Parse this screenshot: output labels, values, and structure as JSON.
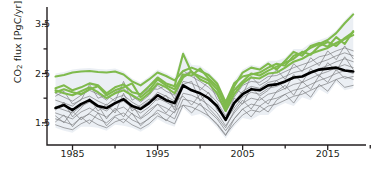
{
  "chart_data": {
    "type": "line",
    "title": "",
    "xlabel": "",
    "ylabel": "CO2 flux [PgC/yr]",
    "ylabel_html": "CO<sub>2</sub> flux [PgC/yr]",
    "xlim": [
      1982,
      2019.5
    ],
    "ylim": [
      1.05,
      3.85
    ],
    "grid": false,
    "legend": "none",
    "y_ticks_major": [
      1.5,
      2.5,
      3.5
    ],
    "y_ticks_minor": [
      2.0,
      3.0
    ],
    "y_tick_labels": [
      "1.5",
      "2.5",
      "3.5"
    ],
    "x_ticks_major": [
      1985,
      1995,
      2005,
      2015
    ],
    "x_ticks_minor": [
      1990,
      2000,
      2010,
      2020
    ],
    "x_tick_labels": [
      "1985",
      "1995",
      "2005",
      "2015"
    ],
    "x": [
      1983,
      1984,
      1985,
      1986,
      1987,
      1988,
      1989,
      1990,
      1991,
      1992,
      1993,
      1994,
      1995,
      1996,
      1997,
      1998,
      1999,
      2000,
      2001,
      2002,
      2003,
      2004,
      2005,
      2006,
      2007,
      2008,
      2009,
      2010,
      2011,
      2012,
      2013,
      2014,
      2015,
      2016,
      2017,
      2018
    ],
    "colors": {
      "ensemble_gray": "#808285",
      "highlight_green": "#7fba4c",
      "mean_black": "#000000",
      "spread_band": "#e8ecf2",
      "axis": "#231f20",
      "background": "#ffffff"
    },
    "series": [
      {
        "name": "green-1",
        "group": "highlight",
        "color": "#7fba4c",
        "values": [
          2.44,
          2.47,
          2.52,
          2.54,
          2.55,
          2.53,
          2.52,
          2.54,
          2.48,
          2.34,
          2.26,
          2.38,
          2.52,
          2.45,
          2.36,
          2.55,
          2.62,
          2.55,
          2.47,
          2.3,
          1.92,
          2.3,
          2.44,
          2.48,
          2.52,
          2.62,
          2.7,
          2.66,
          2.86,
          2.92,
          3.02,
          3.1,
          3.18,
          3.32,
          3.52,
          3.7
        ]
      },
      {
        "name": "green-2",
        "group": "highlight",
        "color": "#7fba4c",
        "values": [
          2.2,
          2.26,
          2.16,
          2.22,
          2.3,
          2.26,
          2.1,
          2.22,
          2.28,
          2.12,
          2.08,
          2.24,
          2.42,
          2.3,
          2.24,
          2.9,
          2.52,
          2.44,
          2.36,
          2.18,
          1.86,
          2.24,
          2.52,
          2.62,
          2.58,
          2.7,
          2.58,
          2.76,
          2.94,
          2.86,
          3.06,
          3.12,
          3.04,
          3.24,
          3.1,
          3.36
        ]
      },
      {
        "name": "green-3",
        "group": "highlight",
        "color": "#7fba4c",
        "values": [
          2.12,
          2.18,
          2.12,
          2.08,
          2.18,
          2.24,
          2.06,
          2.16,
          2.22,
          2.3,
          2.02,
          2.16,
          2.38,
          2.26,
          2.18,
          2.48,
          2.46,
          2.6,
          2.4,
          2.24,
          1.8,
          2.16,
          2.34,
          2.5,
          2.46,
          2.56,
          2.64,
          2.72,
          2.8,
          2.94,
          2.88,
          3.06,
          3.14,
          3.06,
          3.22,
          3.34
        ]
      },
      {
        "name": "green-4",
        "group": "highlight",
        "color": "#7fba4c",
        "values": [
          2.16,
          2.1,
          2.06,
          2.14,
          2.22,
          2.12,
          2.0,
          2.1,
          2.16,
          2.06,
          1.96,
          2.1,
          2.3,
          2.22,
          2.1,
          2.42,
          2.54,
          2.38,
          2.3,
          2.1,
          1.74,
          2.08,
          2.3,
          2.42,
          2.4,
          2.5,
          2.52,
          2.62,
          2.74,
          2.8,
          2.9,
          2.96,
          3.02,
          3.12,
          3.2,
          3.28
        ]
      },
      {
        "name": "gray-1",
        "group": "ensemble",
        "color": "#808285",
        "values": [
          2.1,
          2.02,
          1.94,
          2.06,
          2.16,
          2.08,
          1.96,
          2.12,
          2.2,
          2.04,
          1.92,
          2.06,
          2.26,
          2.14,
          2.06,
          2.56,
          2.44,
          2.34,
          2.22,
          2.06,
          1.72,
          2.02,
          2.26,
          2.34,
          2.32,
          2.44,
          2.46,
          2.54,
          2.62,
          2.68,
          2.74,
          2.84,
          2.88,
          2.96,
          3.02,
          2.96
        ]
      },
      {
        "name": "gray-2",
        "group": "ensemble",
        "color": "#808285",
        "values": [
          1.96,
          1.9,
          1.84,
          1.98,
          2.04,
          1.94,
          1.86,
          2.0,
          2.06,
          1.92,
          1.82,
          1.94,
          2.12,
          2.04,
          1.94,
          2.34,
          2.3,
          2.22,
          2.1,
          1.92,
          1.64,
          1.92,
          2.14,
          2.24,
          2.2,
          2.32,
          2.36,
          2.44,
          2.52,
          2.56,
          2.64,
          2.72,
          2.78,
          2.86,
          2.92,
          2.86
        ]
      },
      {
        "name": "gray-3",
        "group": "ensemble",
        "color": "#808285",
        "values": [
          1.82,
          1.76,
          1.7,
          1.84,
          1.92,
          1.82,
          1.74,
          1.88,
          1.94,
          1.8,
          1.7,
          1.82,
          2.0,
          1.92,
          1.82,
          2.22,
          2.18,
          2.1,
          1.98,
          1.8,
          1.54,
          1.8,
          2.02,
          2.12,
          2.08,
          2.2,
          2.24,
          2.32,
          2.4,
          2.44,
          2.52,
          2.6,
          2.66,
          2.74,
          2.8,
          2.74
        ]
      },
      {
        "name": "gray-4",
        "group": "ensemble",
        "color": "#808285",
        "values": [
          1.7,
          1.64,
          1.58,
          1.72,
          1.8,
          1.7,
          1.62,
          1.76,
          1.82,
          1.68,
          1.58,
          1.7,
          1.88,
          1.8,
          1.7,
          2.1,
          2.06,
          1.98,
          1.86,
          1.7,
          1.44,
          1.7,
          1.9,
          2.0,
          1.96,
          2.08,
          2.12,
          2.2,
          2.28,
          2.32,
          2.4,
          2.48,
          2.54,
          2.62,
          2.68,
          2.62
        ]
      },
      {
        "name": "gray-5",
        "group": "ensemble",
        "color": "#808285",
        "values": [
          1.58,
          1.52,
          1.46,
          1.6,
          1.68,
          1.58,
          1.5,
          1.64,
          1.7,
          1.56,
          1.48,
          1.58,
          1.76,
          1.68,
          1.58,
          1.98,
          1.94,
          1.86,
          1.74,
          1.58,
          1.34,
          1.58,
          1.78,
          1.88,
          1.84,
          1.96,
          2.0,
          2.08,
          2.16,
          2.2,
          2.28,
          2.36,
          2.42,
          2.5,
          2.56,
          2.5
        ]
      },
      {
        "name": "gray-6",
        "group": "ensemble",
        "color": "#808285",
        "values": [
          1.46,
          1.4,
          1.36,
          1.48,
          1.56,
          1.46,
          1.4,
          1.52,
          1.58,
          1.46,
          1.38,
          1.48,
          1.64,
          1.56,
          1.48,
          1.86,
          1.82,
          1.74,
          1.64,
          1.48,
          1.26,
          1.48,
          1.66,
          1.76,
          1.72,
          1.84,
          1.88,
          1.96,
          2.04,
          2.08,
          2.16,
          2.24,
          2.3,
          2.38,
          2.44,
          2.38
        ]
      },
      {
        "name": "gray-7",
        "group": "ensemble",
        "color": "#808285",
        "values": [
          2.04,
          2.14,
          1.88,
          1.96,
          2.28,
          2.0,
          2.06,
          1.94,
          2.34,
          1.96,
          2.06,
          2.2,
          2.18,
          2.26,
          1.98,
          2.46,
          2.56,
          2.16,
          2.34,
          1.98,
          1.8,
          2.22,
          2.08,
          2.44,
          2.26,
          2.36,
          2.58,
          2.38,
          2.7,
          2.54,
          2.82,
          2.66,
          2.96,
          2.78,
          3.06,
          2.8
        ]
      },
      {
        "name": "gray-8",
        "group": "ensemble",
        "color": "#808285",
        "values": [
          1.76,
          1.92,
          1.62,
          1.8,
          2.0,
          1.74,
          1.88,
          1.7,
          2.1,
          1.74,
          1.86,
          1.98,
          1.96,
          2.06,
          1.76,
          2.28,
          2.34,
          1.94,
          2.12,
          1.76,
          1.58,
          2.0,
          1.88,
          2.22,
          2.04,
          2.16,
          2.36,
          2.18,
          2.48,
          2.32,
          2.6,
          2.44,
          2.72,
          2.56,
          2.84,
          2.58
        ]
      },
      {
        "name": "gray-9",
        "group": "ensemble",
        "color": "#808285",
        "values": [
          1.64,
          1.5,
          1.74,
          1.56,
          1.7,
          1.86,
          1.58,
          1.8,
          1.62,
          1.88,
          1.6,
          1.76,
          1.88,
          1.7,
          1.92,
          2.04,
          1.86,
          2.08,
          1.8,
          1.62,
          1.4,
          1.74,
          1.96,
          1.78,
          2.02,
          1.88,
          2.14,
          2.26,
          2.06,
          2.34,
          2.18,
          2.46,
          2.32,
          2.58,
          2.4,
          2.44
        ]
      },
      {
        "name": "gray-10",
        "group": "ensemble",
        "color": "#808285",
        "values": [
          1.52,
          1.66,
          1.42,
          1.62,
          1.48,
          1.7,
          1.44,
          1.62,
          1.5,
          1.7,
          1.44,
          1.6,
          1.7,
          1.54,
          1.74,
          1.86,
          1.7,
          1.9,
          1.64,
          1.46,
          1.24,
          1.58,
          1.78,
          1.62,
          1.84,
          1.72,
          1.96,
          2.08,
          1.9,
          2.16,
          2.02,
          2.28,
          2.14,
          2.38,
          2.22,
          2.26
        ]
      },
      {
        "name": "ensemble-mean",
        "group": "mean",
        "color": "#000000",
        "values": [
          1.8,
          1.86,
          1.76,
          1.88,
          1.96,
          1.84,
          1.8,
          1.9,
          1.98,
          1.84,
          1.78,
          1.9,
          2.06,
          1.96,
          1.9,
          2.26,
          2.16,
          2.1,
          2.0,
          1.84,
          1.56,
          1.9,
          2.08,
          2.18,
          2.16,
          2.26,
          2.28,
          2.34,
          2.42,
          2.44,
          2.52,
          2.58,
          2.6,
          2.62,
          2.56,
          2.54
        ]
      }
    ]
  }
}
